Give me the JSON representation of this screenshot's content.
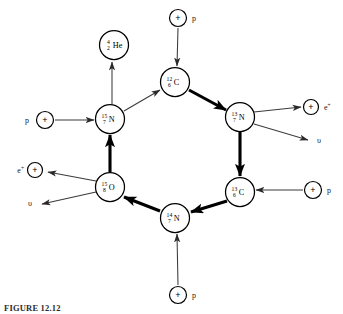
{
  "figure": {
    "caption": "FIGURE 12.12",
    "diagram_title": "CNO cycle",
    "background_color": "#ffffff",
    "ink_color": "#000000"
  },
  "nuclei": [
    {
      "id": "he4",
      "mass": "4",
      "charge": "2",
      "element": "He",
      "cx": 114,
      "cy": 45,
      "r": 14.5,
      "role": "alpha-product"
    },
    {
      "id": "c12",
      "mass": "12",
      "charge": "6",
      "element": "C",
      "cx": 175,
      "cy": 82,
      "r": 14.5,
      "role": "cycle-node"
    },
    {
      "id": "n13",
      "mass": "13",
      "charge": "7",
      "element": "N",
      "cx": 240,
      "cy": 117,
      "r": 14.5,
      "role": "cycle-node"
    },
    {
      "id": "c13",
      "mass": "13",
      "charge": "6",
      "element": "C",
      "cx": 240,
      "cy": 192,
      "r": 14.5,
      "role": "cycle-node"
    },
    {
      "id": "n14",
      "mass": "14",
      "charge": "7",
      "element": "N",
      "cx": 175,
      "cy": 218,
      "r": 14.5,
      "role": "cycle-node"
    },
    {
      "id": "o15",
      "mass": "15",
      "charge": "8",
      "element": "O",
      "cx": 110,
      "cy": 187,
      "r": 14.5,
      "role": "cycle-node"
    },
    {
      "id": "n15",
      "mass": "15",
      "charge": "7",
      "element": "N",
      "cx": 110,
      "cy": 119,
      "r": 14.5,
      "role": "cycle-node"
    }
  ],
  "particles": [
    {
      "id": "p-top",
      "symbol": "+",
      "label": "p",
      "label_sup": "",
      "cx": 178,
      "cy": 18,
      "r": 8.5,
      "label_x": 192,
      "label_y": 21,
      "label_anchor": "start"
    },
    {
      "id": "p-left",
      "symbol": "+",
      "label": "p",
      "label_sup": "",
      "cx": 45,
      "cy": 120,
      "r": 8.5,
      "label_x": 29,
      "label_y": 123,
      "label_anchor": "end"
    },
    {
      "id": "p-right",
      "symbol": "+",
      "label": "p",
      "label_sup": "",
      "cx": 313,
      "cy": 190,
      "r": 8.5,
      "label_x": 327,
      "label_y": 193,
      "label_anchor": "start"
    },
    {
      "id": "p-bottom",
      "symbol": "+",
      "label": "p",
      "label_sup": "",
      "cx": 178,
      "cy": 295,
      "r": 8.5,
      "label_x": 192,
      "label_y": 298,
      "label_anchor": "start"
    },
    {
      "id": "positron-right",
      "symbol": "+",
      "label": "e",
      "label_sup": "+",
      "cx": 311,
      "cy": 107,
      "r": 7.5,
      "label_x": 324,
      "label_y": 110,
      "label_anchor": "start"
    },
    {
      "id": "positron-left",
      "symbol": "+",
      "label": "e",
      "label_sup": "+",
      "cx": 35,
      "cy": 170,
      "r": 7.5,
      "label_x": 24,
      "label_y": 173,
      "label_anchor": "end"
    }
  ],
  "neutrinos": [
    {
      "id": "nu-right",
      "symbol": "υ",
      "x": 317,
      "y": 143,
      "anchor": "start"
    },
    {
      "id": "nu-left",
      "symbol": "υ",
      "x": 32,
      "y": 206,
      "anchor": "end"
    }
  ],
  "arrows": [
    {
      "id": "arrow-n15-to-he4",
      "kind": "thin",
      "from": "n15",
      "to": "he4",
      "x1": 112,
      "y1": 104,
      "x2": 112,
      "y2": 62
    },
    {
      "id": "arrow-p-to-c12",
      "kind": "thin",
      "from": "p-top",
      "to": "c12",
      "x1": 178,
      "y1": 28,
      "x2": 177,
      "y2": 66
    },
    {
      "id": "arrow-n15-to-c12",
      "kind": "thin",
      "from": "n15",
      "to": "c12",
      "x1": 124,
      "y1": 111,
      "x2": 160,
      "y2": 90
    },
    {
      "id": "arrow-c12-to-n13",
      "kind": "thick",
      "from": "c12",
      "to": "n13",
      "x1": 189,
      "y1": 90,
      "x2": 226,
      "y2": 110
    },
    {
      "id": "arrow-p-to-n15",
      "kind": "thin",
      "from": "p-left",
      "to": "n15",
      "x1": 55,
      "y1": 120,
      "x2": 94,
      "y2": 120
    },
    {
      "id": "arrow-n13-to-pos",
      "kind": "thin",
      "from": "n13",
      "to": "positron-right",
      "x1": 254,
      "y1": 112,
      "x2": 301,
      "y2": 107
    },
    {
      "id": "arrow-n13-to-nu",
      "kind": "thin",
      "from": "n13",
      "to": "nu-right",
      "x1": 254,
      "y1": 124,
      "x2": 308,
      "y2": 140
    },
    {
      "id": "arrow-n13-to-c13",
      "kind": "thick",
      "from": "n13",
      "to": "c13",
      "x1": 240,
      "y1": 132,
      "x2": 240,
      "y2": 176
    },
    {
      "id": "arrow-o15-to-n15",
      "kind": "thick",
      "from": "o15",
      "to": "n15",
      "x1": 110,
      "y1": 172,
      "x2": 110,
      "y2": 135
    },
    {
      "id": "arrow-o15-to-pos",
      "kind": "thin",
      "from": "o15",
      "to": "positron-left",
      "x1": 96,
      "y1": 181,
      "x2": 48,
      "y2": 172
    },
    {
      "id": "arrow-o15-to-nu",
      "kind": "thin",
      "from": "o15",
      "to": "nu-left",
      "x1": 96,
      "y1": 192,
      "x2": 42,
      "y2": 204
    },
    {
      "id": "arrow-p-to-c13",
      "kind": "thin",
      "from": "p-right",
      "to": "c13",
      "x1": 303,
      "y1": 190,
      "x2": 256,
      "y2": 190
    },
    {
      "id": "arrow-c13-to-n14",
      "kind": "thick",
      "from": "c13",
      "to": "n14",
      "x1": 227,
      "y1": 201,
      "x2": 191,
      "y2": 212
    },
    {
      "id": "arrow-n14-to-o15",
      "kind": "thick",
      "from": "n14",
      "to": "o15",
      "x1": 160,
      "y1": 211,
      "x2": 124,
      "y2": 197
    },
    {
      "id": "arrow-p-to-n14",
      "kind": "thin",
      "from": "p-bottom",
      "to": "n14",
      "x1": 178,
      "y1": 285,
      "x2": 177,
      "y2": 234
    }
  ]
}
